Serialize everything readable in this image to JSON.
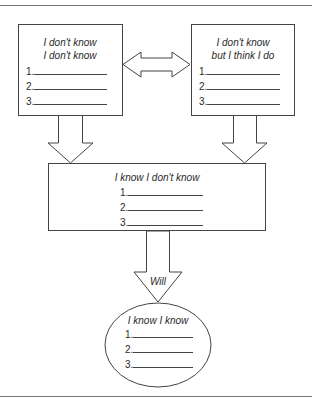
{
  "boxes": {
    "unknown_unknowns": {
      "title_line1": "I don't know",
      "title_line2": "I don't know",
      "items": [
        "1.",
        "2.",
        "3."
      ]
    },
    "false_knowledge": {
      "title_line1": "I don't know",
      "title_line2": "but I think I do",
      "items": [
        "1.",
        "2.",
        "3."
      ]
    },
    "known_unknowns": {
      "title": "I know I don't know",
      "items": [
        "1.",
        "2.",
        "3."
      ]
    },
    "known_knowns": {
      "title": "I know I know",
      "items": [
        "1.",
        "2.",
        "3."
      ]
    }
  },
  "arrows": {
    "will_label": "Will"
  },
  "colors": {
    "stroke": "#444444",
    "rule": "#777777"
  }
}
